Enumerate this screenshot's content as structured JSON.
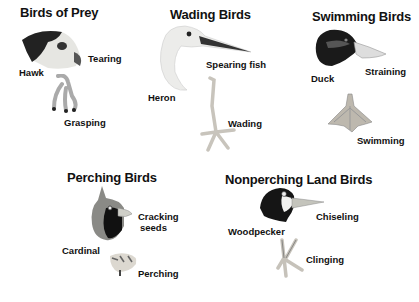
{
  "groups": [
    {
      "name": "Birds of Prey",
      "bird": "Hawk",
      "beak_function": "Tearing",
      "foot_function": "Grasping"
    },
    {
      "name": "Wading Birds",
      "bird": "Heron",
      "beak_function": "Spearing fish",
      "foot_function": "Wading"
    },
    {
      "name": "Swimming Birds",
      "bird": "Duck",
      "beak_function": "Straining",
      "foot_function": "Swimming"
    },
    {
      "name": "Perching Birds",
      "bird": "Cardinal",
      "beak_function_line1": "Cracking",
      "beak_function_line2": "seeds",
      "foot_function": "Perching"
    },
    {
      "name": "Nonperching Land Birds",
      "bird": "Woodpecker",
      "beak_function": "Chiseling",
      "foot_function": "Clinging"
    }
  ],
  "colors": {
    "background": "#ffffff",
    "text": "#111111",
    "dark_plumage": "#1a1a1a",
    "beak": "#b8b8b0",
    "foot": "#c8c4bc"
  }
}
